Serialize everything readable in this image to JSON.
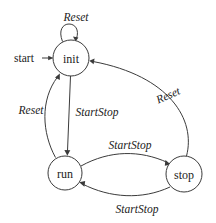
{
  "diagram": {
    "type": "finite-state-machine",
    "colors": {
      "background": "#ffffff",
      "stroke": "#3b3b3b",
      "text": "#1b1b1b"
    },
    "entry": {
      "label": "start",
      "target": "init"
    },
    "states": [
      {
        "id": "init",
        "label": "init",
        "cx": 71,
        "cy": 58,
        "r": 18
      },
      {
        "id": "run",
        "label": "run",
        "cx": 65,
        "cy": 173,
        "r": 17
      },
      {
        "id": "stop",
        "label": "stop",
        "cx": 184,
        "cy": 174,
        "r": 18
      }
    ],
    "transitions": [
      {
        "id": "init-self",
        "from": "init",
        "to": "init",
        "label": "Reset",
        "label_x": 76,
        "label_y": 17
      },
      {
        "id": "init-run",
        "from": "init",
        "to": "run",
        "label": "StartStop",
        "label_x": 97,
        "label_y": 112
      },
      {
        "id": "run-init",
        "from": "run",
        "to": "init",
        "label": "Reset",
        "label_x": 31,
        "label_y": 110
      },
      {
        "id": "run-stop",
        "from": "run",
        "to": "stop",
        "label": "StartStop",
        "label_x": 130,
        "label_y": 145
      },
      {
        "id": "stop-run",
        "from": "stop",
        "to": "run",
        "label": "StartStop",
        "label_x": 137,
        "label_y": 209
      },
      {
        "id": "stop-init",
        "from": "stop",
        "to": "init",
        "label": "Reset",
        "label_x": 168,
        "label_y": 95
      }
    ]
  }
}
